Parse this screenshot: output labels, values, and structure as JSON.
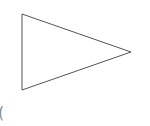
{
  "diagram": {
    "shape": "triangle",
    "orientation": "pointing-right",
    "vertices": [
      [
        22,
        14
      ],
      [
        131,
        52
      ],
      [
        22,
        90
      ]
    ],
    "stroke_color": "#555555",
    "fill_color": "#ffffff",
    "stroke_width": 1
  },
  "fragment": {
    "text": "("
  }
}
